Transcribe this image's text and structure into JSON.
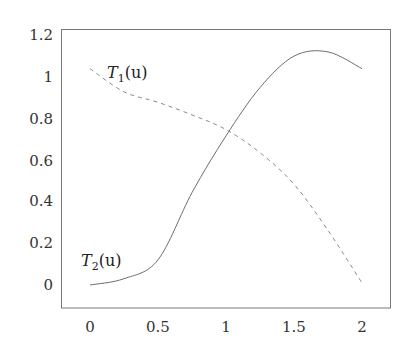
{
  "chart_data": {
    "type": "line",
    "title": "",
    "xlabel": "",
    "ylabel": "",
    "xlim": [
      -0.2,
      2.2
    ],
    "ylim": [
      -0.11,
      1.22
    ],
    "xticks": [
      "0",
      "0.5",
      "1",
      "1.5",
      "2"
    ],
    "yticks": [
      "0",
      "0.2",
      "0.4",
      "0.6",
      "0.8",
      "1",
      "1.2"
    ],
    "grid": false,
    "legend": "inline labels",
    "x": [
      0,
      0.25,
      0.5,
      0.75,
      1.0,
      1.25,
      1.5,
      1.75,
      2.0
    ],
    "series": [
      {
        "name": "T1(u)",
        "style": "dashed",
        "values": [
          1.03,
          0.92,
          0.87,
          0.81,
          0.74,
          0.63,
          0.48,
          0.26,
          0.01
        ]
      },
      {
        "name": "T2(u)",
        "style": "solid",
        "values": [
          0.0,
          0.03,
          0.12,
          0.44,
          0.71,
          0.94,
          1.09,
          1.11,
          1.03
        ]
      }
    ],
    "annotations": [
      {
        "text": "T1(u)",
        "near": [
          0.1,
          1.03
        ]
      },
      {
        "text": "T2(u)",
        "near": [
          0.1,
          0.12
        ]
      }
    ]
  },
  "labels": {
    "t1": {
      "base": "T",
      "sub": "1",
      "arg": "(u)"
    },
    "t2": {
      "base": "T",
      "sub": "2",
      "arg": "(u)"
    }
  },
  "ticks": {
    "x": [
      "0",
      "0.5",
      "1",
      "1.5",
      "2"
    ],
    "y": [
      "1.2",
      "1",
      "0.8",
      "0.6",
      "0.4",
      "0.2",
      "0"
    ]
  }
}
